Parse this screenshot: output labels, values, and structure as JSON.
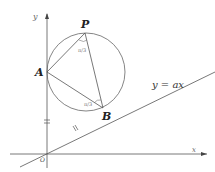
{
  "diagram": {
    "points": {
      "P": {
        "label": "P",
        "x": 85,
        "y": 33
      },
      "A": {
        "label": "A",
        "x": 47,
        "y": 72
      },
      "B": {
        "label": "B",
        "x": 103,
        "y": 108
      },
      "O": {
        "label": "O",
        "x": 47,
        "y": 154
      }
    },
    "circle": {
      "cx": 86,
      "cy": 72,
      "r": 39
    },
    "axes": {
      "x_label": "x",
      "y_label": "y"
    },
    "line_label": "y = ax",
    "angle_labels": {
      "at_P": "π/3",
      "at_B": "π/3"
    },
    "tick_marks": {
      "OA": "=",
      "OB": "="
    },
    "colors": {
      "stroke": "#555555",
      "text": "#222222"
    }
  }
}
